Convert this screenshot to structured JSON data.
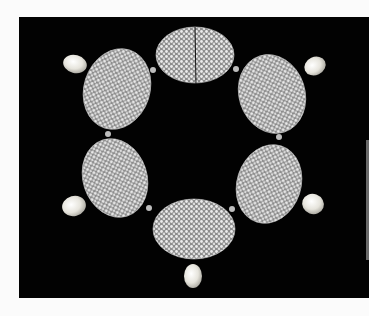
{
  "image": {
    "subject": "diamond and pearl necklace on black background",
    "background_color": "#020202",
    "page_color": "#fbfbfb",
    "elements": {
      "oval_clusters": 6,
      "pearl_drops": 5
    }
  }
}
